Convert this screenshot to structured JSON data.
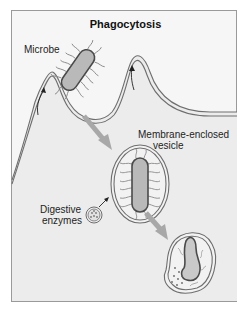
{
  "diagram": {
    "title": "Phagocytosis",
    "labels": {
      "microbe": "Microbe",
      "vesicle_line1": "Membrane-enclosed",
      "vesicle_line2": "vesicle",
      "enzymes_line1": "Digestive",
      "enzymes_line2": "enzymes"
    },
    "stages": [
      {
        "name": "engulfment",
        "description": "Cell membrane extends around microbe"
      },
      {
        "name": "vesicle",
        "description": "Microbe enclosed in membrane vesicle"
      },
      {
        "name": "digestion",
        "description": "Digestive enzymes break down microbe"
      }
    ],
    "colors": {
      "background": "#f6f6f6",
      "frame": "#9a9a9a",
      "cell_interior": "#e9e9e9",
      "membrane": "#6e6e6e",
      "microbe_fill": "#b9b9b9",
      "process_arrow": "#a8a8a8",
      "text": "#1e1e1e"
    }
  }
}
